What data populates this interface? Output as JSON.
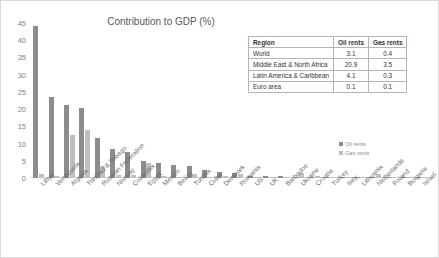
{
  "chart_data": {
    "type": "bar",
    "title": "Contribution to GDP (%)",
    "xlabel": "",
    "ylabel": "",
    "ylim": [
      0,
      45
    ],
    "yticks": [
      0,
      5,
      10,
      15,
      20,
      25,
      30,
      35,
      40,
      45
    ],
    "grid": false,
    "legend_position": "right",
    "categories": [
      "Libya",
      "Venezuela",
      "Algeria",
      "Trinidad & Tobago",
      "Russian Federation",
      "Norway",
      "Colombia",
      "Egypt",
      "Mexico",
      "Belize",
      "Tunisia",
      "Cuba",
      "Denmark",
      "Romania",
      "US",
      "UK",
      "Barbados",
      "Ukraine",
      "Croatia",
      "Turkey",
      "Italy",
      "Lithuania",
      "Netherlands",
      "Poland",
      "Bulgaria",
      "Israel"
    ],
    "series": [
      {
        "name": "Oil rents",
        "color": "#8c8c8c",
        "values": [
          44.0,
          23.5,
          21.3,
          20.2,
          11.5,
          8.3,
          7.5,
          4.8,
          4.5,
          3.7,
          3.4,
          2.3,
          1.7,
          1.4,
          0.7,
          0.5,
          0.5,
          0.4,
          0.3,
          0.2,
          0.2,
          0.1,
          0.1,
          0.1,
          0.1,
          0.1
        ]
      },
      {
        "name": "Gas rents",
        "color": "#bfbfbf",
        "values": [
          1.2,
          0.5,
          12.4,
          14.0,
          3.5,
          1.0,
          1.0,
          4.3,
          0.5,
          0.1,
          1.2,
          0.3,
          0.6,
          1.1,
          0.4,
          0.2,
          0.1,
          1.6,
          0.6,
          0.2,
          0.2,
          0.1,
          1.2,
          0.2,
          0.2,
          0.1
        ]
      }
    ]
  },
  "table": {
    "headers": [
      "Region",
      "Oil rents",
      "Gas rents"
    ],
    "rows": [
      {
        "region": "World",
        "oil": "3.1",
        "gas": "0.4"
      },
      {
        "region": "Middle East & North Africa",
        "oil": "20.9",
        "gas": "3.5"
      },
      {
        "region": "Latin America & Caribbean",
        "oil": "4.1",
        "gas": "0.3"
      },
      {
        "region": "Euro area",
        "oil": "0.1",
        "gas": "0.1"
      }
    ]
  }
}
